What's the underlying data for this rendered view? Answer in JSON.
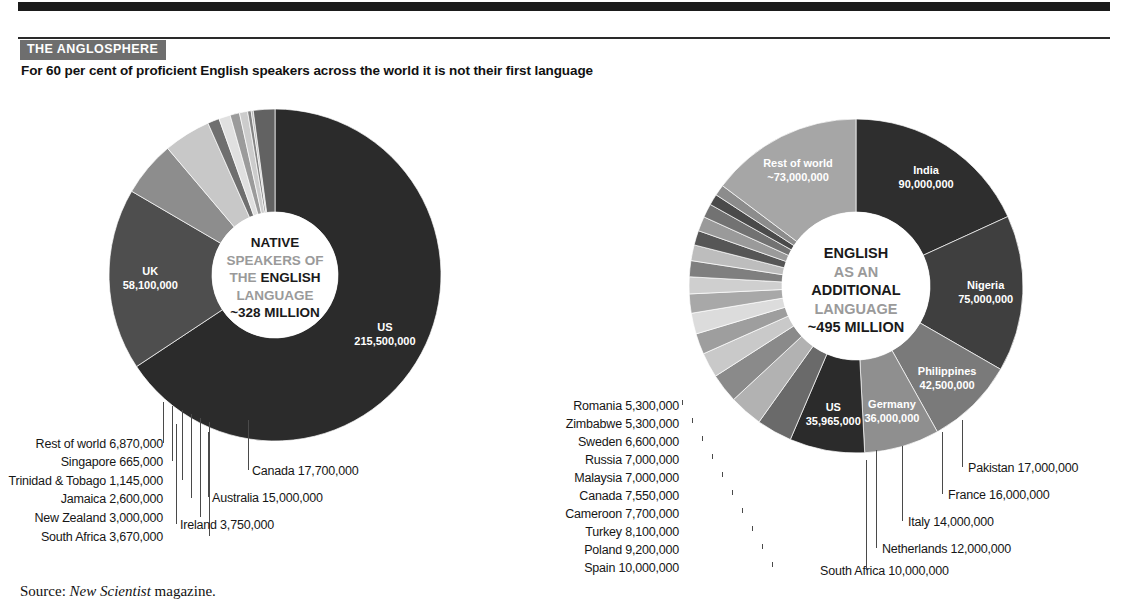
{
  "header": {
    "kicker": "THE ANGLOSPHERE",
    "deck": "For 60 per cent of proficient English speakers across the world it is not their first language"
  },
  "source": {
    "prefix": "Source:",
    "publication": "New Scientist",
    "suffix": "magazine."
  },
  "palette": {
    "darkest": "#2b2b2b",
    "dark": "#3b3b3b",
    "mid_dark": "#585858",
    "mid": "#777777",
    "mid_light": "#969696",
    "light": "#b4b4b4",
    "lightest": "#d2d2d2",
    "pale": "#e3e3e3",
    "white": "#ffffff",
    "leader": "#4a4a4a"
  },
  "chart_data": [
    {
      "type": "pie",
      "id": "native-speakers",
      "title": "NATIVE SPEAKERS OF THE ENGLISH LANGUAGE",
      "center_lines": [
        {
          "text": "NATIVE",
          "emphasis": "strong"
        },
        {
          "text": "SPEAKERS OF",
          "emphasis": "soft"
        },
        {
          "text": "THE ENGLISH",
          "emphasis": "mixed"
        },
        {
          "text": "LANGUAGE",
          "emphasis": "soft"
        },
        {
          "text": "~328 MILLION",
          "emphasis": "strong"
        }
      ],
      "total_label": "~328 MILLION",
      "total_value": 328000000,
      "unit": "speakers",
      "categories": [
        "US",
        "UK",
        "Canada",
        "Australia",
        "Ireland",
        "South Africa",
        "New Zealand",
        "Jamaica",
        "Trinidad & Tobago",
        "Singapore",
        "Rest of world"
      ],
      "values": [
        215500000,
        58100000,
        17700000,
        15000000,
        3750000,
        3670000,
        3000000,
        2600000,
        1145000,
        665000,
        6870000
      ],
      "value_labels": [
        "215,500,000",
        "58,100,000",
        "17,700,000",
        "15,000,000",
        "3,750,000",
        "3,670,000",
        "3,000,000",
        "2,600,000",
        "1,145,000",
        "665,000",
        "6,870,000"
      ],
      "colors": [
        "#2b2b2b",
        "#4e4e4e",
        "#8d8d8d",
        "#c8c8c8",
        "#6f6f6f",
        "#e0e0e0",
        "#9b9b9b",
        "#cccccc",
        "#838383",
        "#b8b8b8",
        "#626262"
      ],
      "inside_labels": [
        {
          "name": "US",
          "value": "215,500,000"
        },
        {
          "name": "UK",
          "value": "58,100,000"
        }
      ],
      "callouts_right": [
        {
          "name": "Canada",
          "value": "17,700,000"
        },
        {
          "name": "Australia",
          "value": "15,000,000"
        },
        {
          "name": "Ireland",
          "value": "3,750,000"
        }
      ],
      "callouts_left": [
        {
          "name": "Rest of world",
          "value": "6,870,000"
        },
        {
          "name": "Singapore",
          "value": "665,000"
        },
        {
          "name": "Trinidad & Tobago",
          "value": "1,145,000"
        },
        {
          "name": "Jamaica",
          "value": "2,600,000"
        },
        {
          "name": "New Zealand",
          "value": "3,000,000"
        },
        {
          "name": "South Africa",
          "value": "3,670,000"
        }
      ]
    },
    {
      "type": "pie",
      "id": "additional-language",
      "title": "ENGLISH AS AN ADDITIONAL LANGUAGE",
      "center_lines": [
        {
          "text": "ENGLISH",
          "emphasis": "strong"
        },
        {
          "text": "AS AN",
          "emphasis": "soft"
        },
        {
          "text": "ADDITIONAL",
          "emphasis": "strong"
        },
        {
          "text": "LANGUAGE",
          "emphasis": "soft"
        },
        {
          "text": "~495 MILLION",
          "emphasis": "strong"
        }
      ],
      "total_label": "~495 MILLION",
      "total_value": 495000000,
      "unit": "speakers",
      "categories": [
        "India",
        "Nigeria",
        "Philippines",
        "Germany",
        "US",
        "Pakistan",
        "France",
        "Italy",
        "Netherlands",
        "South Africa",
        "Spain",
        "Poland",
        "Turkey",
        "Cameroon",
        "Canada",
        "Malaysia",
        "Russia",
        "Sweden",
        "Zimbabwe",
        "Romania",
        "Rest of world"
      ],
      "values": [
        90000000,
        75000000,
        42500000,
        36000000,
        35965000,
        17000000,
        16000000,
        14000000,
        12000000,
        10000000,
        10000000,
        9200000,
        8100000,
        7700000,
        7550000,
        7000000,
        7000000,
        6600000,
        5300000,
        5300000,
        73000000
      ],
      "value_labels": [
        "90,000,000",
        "75,000,000",
        "42,500,000",
        "36,000,000",
        "35,965,000",
        "17,000,000",
        "16,000,000",
        "14,000,000",
        "12,000,000",
        "10,000,000",
        "10,000,000",
        "9,200,000",
        "8,100,000",
        "7,700,000",
        "7,550,000",
        "7,000,000",
        "7,000,000",
        "6,600,000",
        "5,300,000",
        "5,300,000",
        "~73,000,000"
      ],
      "colors": [
        "#2e2e2e",
        "#3f3f3f",
        "#7a7a7a",
        "#8f8f8f",
        "#2b2b2b",
        "#6a6a6a",
        "#b2b2b2",
        "#8a8a8a",
        "#c9c9c9",
        "#9e9e9e",
        "#dcdcdc",
        "#a8a8a8",
        "#cfcfcf",
        "#7f7f7f",
        "#bdbdbd",
        "#565656",
        "#9a9a9a",
        "#727272",
        "#4a4a4a",
        "#8c8c8c",
        "#a6a6a6"
      ],
      "inside_labels": [
        {
          "name": "India",
          "value": "90,000,000"
        },
        {
          "name": "Nigeria",
          "value": "75,000,000"
        },
        {
          "name": "Philippines",
          "value": "42,500,000"
        },
        {
          "name": "Germany",
          "value": "36,000,000"
        },
        {
          "name": "US",
          "value": "35,965,000"
        },
        {
          "name": "Rest of world",
          "value": "~73,000,000"
        }
      ],
      "callouts_left": [
        {
          "name": "Romania",
          "value": "5,300,000"
        },
        {
          "name": "Zimbabwe",
          "value": "5,300,000"
        },
        {
          "name": "Sweden",
          "value": "6,600,000"
        },
        {
          "name": "Russia",
          "value": "7,000,000"
        },
        {
          "name": "Malaysia",
          "value": "7,000,000"
        },
        {
          "name": "Canada",
          "value": "7,550,000"
        },
        {
          "name": "Cameroon",
          "value": "7,700,000"
        },
        {
          "name": "Turkey",
          "value": "8,100,000"
        },
        {
          "name": "Poland",
          "value": "9,200,000"
        },
        {
          "name": "Spain",
          "value": "10,000,000"
        }
      ],
      "callouts_right": [
        {
          "name": "Pakistan",
          "value": "17,000,000"
        },
        {
          "name": "France",
          "value": "16,000,000"
        },
        {
          "name": "Italy",
          "value": "14,000,000"
        },
        {
          "name": "Netherlands",
          "value": "12,000,000"
        },
        {
          "name": "South Africa",
          "value": "10,000,000"
        }
      ]
    }
  ]
}
